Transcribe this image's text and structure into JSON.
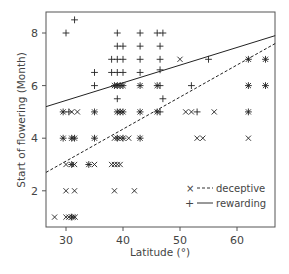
{
  "chart_data": {
    "type": "scatter",
    "title": "",
    "xlabel": "Latitude (°)",
    "ylabel": "Start of flowering (Month)",
    "xlim": [
      26.5,
      66.7
    ],
    "ylim": [
      0.6,
      8.8
    ],
    "xticks": [
      30,
      40,
      50,
      60
    ],
    "yticks": [
      2,
      4,
      6,
      8
    ],
    "grid": false,
    "legend_position": "lower right, inside",
    "legend": [
      {
        "marker": "×",
        "line": "dashed",
        "label": "deceptive"
      },
      {
        "marker": "+",
        "line": "solid",
        "label": "rewarding"
      }
    ],
    "series": [
      {
        "name": "deceptive",
        "marker": "x",
        "points": [
          [
            28,
            1
          ],
          [
            30,
            1
          ],
          [
            30.5,
            1
          ],
          [
            31,
            1
          ],
          [
            31.3,
            1
          ],
          [
            31.6,
            1
          ],
          [
            30,
            2
          ],
          [
            31.5,
            2
          ],
          [
            38.5,
            2
          ],
          [
            42,
            2
          ],
          [
            30,
            3
          ],
          [
            31,
            3
          ],
          [
            31.5,
            3
          ],
          [
            34,
            3
          ],
          [
            35,
            3
          ],
          [
            38,
            3
          ],
          [
            38.5,
            3
          ],
          [
            39,
            3
          ],
          [
            39.5,
            3
          ],
          [
            29.5,
            4
          ],
          [
            31,
            4
          ],
          [
            31.5,
            4
          ],
          [
            35,
            4
          ],
          [
            38.5,
            4
          ],
          [
            39,
            4
          ],
          [
            39.5,
            4
          ],
          [
            40,
            4
          ],
          [
            41,
            4
          ],
          [
            43,
            4
          ],
          [
            53,
            4
          ],
          [
            54,
            4
          ],
          [
            62,
            4
          ],
          [
            29.5,
            5
          ],
          [
            31,
            5
          ],
          [
            32,
            5
          ],
          [
            35,
            5
          ],
          [
            39,
            5
          ],
          [
            39.5,
            5
          ],
          [
            40,
            5
          ],
          [
            43,
            5
          ],
          [
            46,
            5
          ],
          [
            51,
            5
          ],
          [
            52,
            5
          ],
          [
            56,
            5
          ],
          [
            62,
            5
          ],
          [
            38.5,
            6
          ],
          [
            39,
            6
          ],
          [
            39.5,
            6
          ],
          [
            40,
            6
          ],
          [
            43,
            6
          ],
          [
            46,
            6
          ],
          [
            62,
            6
          ],
          [
            65,
            6
          ],
          [
            50,
            7
          ],
          [
            62,
            7
          ],
          [
            65,
            7
          ]
        ]
      },
      {
        "name": "rewarding",
        "marker": "+",
        "points": [
          [
            31,
            1
          ],
          [
            31,
            3
          ],
          [
            34,
            3
          ],
          [
            29.5,
            4
          ],
          [
            31,
            4
          ],
          [
            31.5,
            4
          ],
          [
            35,
            4
          ],
          [
            39,
            4
          ],
          [
            40,
            4
          ],
          [
            43,
            4
          ],
          [
            29.5,
            5
          ],
          [
            30.5,
            5
          ],
          [
            35,
            5
          ],
          [
            39,
            5
          ],
          [
            39.5,
            5
          ],
          [
            40,
            5
          ],
          [
            43,
            5
          ],
          [
            46,
            5
          ],
          [
            46.5,
            5
          ],
          [
            53,
            5
          ],
          [
            62,
            5
          ],
          [
            39,
            5.5
          ],
          [
            47,
            5.5
          ],
          [
            35,
            6
          ],
          [
            38.5,
            6
          ],
          [
            39,
            6
          ],
          [
            39.5,
            6
          ],
          [
            40,
            6
          ],
          [
            43,
            6
          ],
          [
            46,
            6
          ],
          [
            46.5,
            6
          ],
          [
            52,
            6
          ],
          [
            62,
            6
          ],
          [
            65,
            6
          ],
          [
            35,
            6.5
          ],
          [
            38,
            6.5
          ],
          [
            39,
            6.5
          ],
          [
            40,
            6.5
          ],
          [
            43,
            6.5
          ],
          [
            46.5,
            6.6
          ],
          [
            38,
            7
          ],
          [
            39,
            7
          ],
          [
            40,
            7
          ],
          [
            43,
            7
          ],
          [
            46.5,
            7
          ],
          [
            55,
            7
          ],
          [
            62,
            7
          ],
          [
            65,
            7
          ],
          [
            39,
            7.5
          ],
          [
            40,
            7.5
          ],
          [
            43,
            7.5
          ],
          [
            46.5,
            7.5
          ],
          [
            30,
            8
          ],
          [
            39,
            8
          ],
          [
            43,
            8
          ],
          [
            46,
            8
          ],
          [
            47,
            8
          ],
          [
            31.5,
            8.5
          ]
        ]
      }
    ],
    "fit_lines": [
      {
        "name": "rewarding",
        "style": "solid",
        "from": [
          26.5,
          5.2
        ],
        "to": [
          66.7,
          7.9
        ]
      },
      {
        "name": "deceptive",
        "style": "dashed",
        "from": [
          26.5,
          2.7
        ],
        "to": [
          66.7,
          7.6
        ]
      }
    ]
  },
  "plot": {
    "box": {
      "left": 46,
      "top": 12,
      "right": 275,
      "bottom": 227
    },
    "x_px_per_unit": 5.7,
    "x_ref": [
      30,
      66
    ],
    "y_px_per_unit": 26.3,
    "y_ref": [
      8,
      33
    ],
    "line_color": "#222222",
    "axis_color": "#555555",
    "marker_color": "#222222"
  }
}
